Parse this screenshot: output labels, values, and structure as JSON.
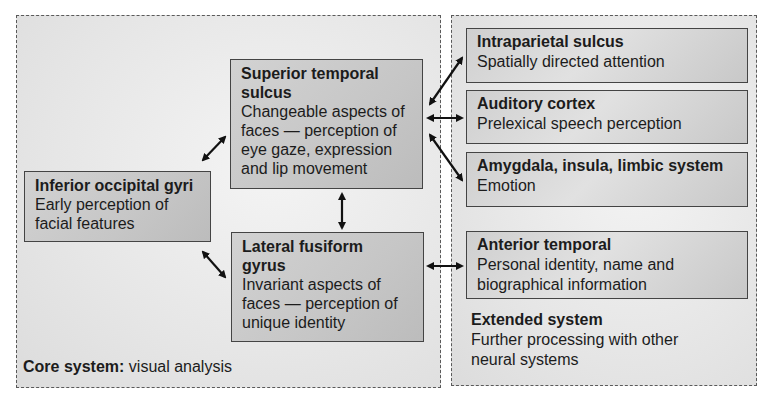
{
  "core_system": {
    "caption_bold": "Core system:",
    "caption_text": " visual analysis",
    "nodes": {
      "inferior_occipital": {
        "title": "Inferior occipital gyri",
        "description": "Early perception of facial features"
      },
      "superior_temporal": {
        "title": "Superior temporal sulcus",
        "description": "Changeable aspects of faces — perception of eye gaze, expression and lip movement"
      },
      "lateral_fusiform": {
        "title": "Lateral fusiform gyrus",
        "description": "Invariant aspects of faces — perception of unique identity"
      }
    }
  },
  "extended_system": {
    "caption_bold": "Extended system",
    "caption_text": "Further processing with other neural systems",
    "nodes": {
      "intraparietal": {
        "title": "Intraparietal sulcus",
        "description": "Spatially directed attention"
      },
      "auditory": {
        "title": "Auditory cortex",
        "description": "Prelexical speech perception"
      },
      "amygdala": {
        "title": "Amygdala, insula, limbic system",
        "description": "Emotion"
      },
      "anterior_temporal": {
        "title": "Anterior temporal",
        "description": "Personal identity, name and biographical information"
      }
    }
  },
  "connections": [
    {
      "from": "Inferior occipital gyri",
      "to": "Superior temporal sulcus",
      "type": "bidirectional"
    },
    {
      "from": "Inferior occipital gyri",
      "to": "Lateral fusiform gyrus",
      "type": "bidirectional"
    },
    {
      "from": "Superior temporal sulcus",
      "to": "Lateral fusiform gyrus",
      "type": "bidirectional"
    },
    {
      "from": "Superior temporal sulcus",
      "to": "Intraparietal sulcus",
      "type": "bidirectional"
    },
    {
      "from": "Superior temporal sulcus",
      "to": "Auditory cortex",
      "type": "bidirectional"
    },
    {
      "from": "Superior temporal sulcus",
      "to": "Amygdala, insula, limbic system",
      "type": "bidirectional"
    },
    {
      "from": "Lateral fusiform gyrus",
      "to": "Anterior temporal",
      "type": "bidirectional"
    }
  ],
  "colors": {
    "box_fill": "#c8c8c8",
    "panel_fill": "#e8e8e8",
    "border": "#444444",
    "arrow": "#111111"
  }
}
